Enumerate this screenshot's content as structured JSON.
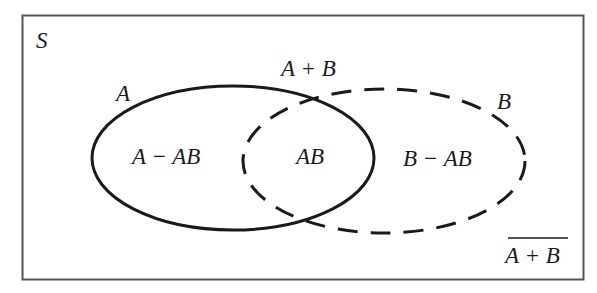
{
  "diagram": {
    "type": "venn",
    "universe_label": "S",
    "sets": [
      {
        "name": "A",
        "label": "A",
        "style": "solid"
      },
      {
        "name": "B",
        "label": "B",
        "style": "dashed"
      }
    ],
    "region_labels": {
      "a_only": "A − AB",
      "intersection": "AB",
      "b_only": "B − AB"
    },
    "union_label": "A + B",
    "complement_label": "A + B",
    "colors": {
      "stroke": "#1a1a1a",
      "frame": "#555555",
      "background": "#ffffff"
    }
  }
}
